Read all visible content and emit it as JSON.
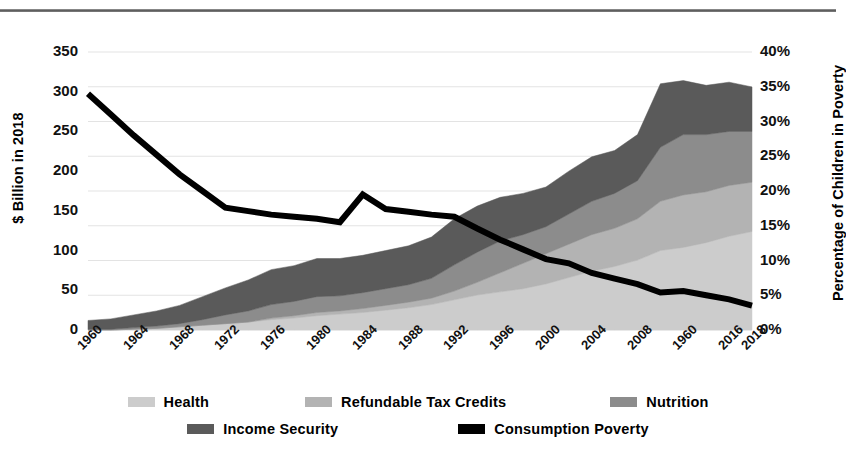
{
  "chart_data": {
    "type": "area",
    "title": "",
    "subtitle": "",
    "xlabel": "",
    "ylabel": "$ Billion in 2018",
    "y2label": "Percentage of Children in Poverty",
    "grid": true,
    "legend_position": "bottom",
    "ylim": [
      0,
      350
    ],
    "y2lim": [
      0,
      40
    ],
    "xlim": [
      1960,
      2018
    ],
    "yticks": [
      "0",
      "50",
      "100",
      "150",
      "200",
      "250",
      "300",
      "350"
    ],
    "ytick_values": [
      0,
      50,
      100,
      150,
      200,
      250,
      300,
      350
    ],
    "y2ticks": [
      "0%",
      "5%",
      "10%",
      "15%",
      "20%",
      "25%",
      "30%",
      "35%",
      "40%"
    ],
    "y2tick_values": [
      0,
      5,
      10,
      15,
      20,
      25,
      30,
      35,
      40
    ],
    "xticks": [
      "1960",
      "1964",
      "1968",
      "1972",
      "1976",
      "1980",
      "1984",
      "1988",
      "1992",
      "1996",
      "2000",
      "2004",
      "2008",
      "1960",
      "2016",
      "2018"
    ],
    "xtick_values": [
      1960,
      1964,
      1968,
      1972,
      1976,
      1980,
      1984,
      1988,
      1992,
      1996,
      2000,
      2004,
      2008,
      2012,
      2016,
      2018
    ],
    "x": [
      1960,
      1962,
      1964,
      1966,
      1968,
      1970,
      1972,
      1974,
      1976,
      1978,
      1980,
      1982,
      1984,
      1986,
      1988,
      1990,
      1992,
      1994,
      1996,
      1998,
      2000,
      2002,
      2004,
      2006,
      2008,
      2010,
      2012,
      2014,
      2016,
      2018
    ],
    "stack_order_bottom_to_top": [
      "Health",
      "Refundable Tax Credits",
      "Nutrition",
      "Income Security"
    ],
    "series": [
      {
        "name": "Health",
        "axis": "left",
        "color": "#cccccc",
        "values": [
          0,
          0,
          1,
          2,
          4,
          6,
          8,
          10,
          13,
          15,
          18,
          20,
          22,
          25,
          28,
          32,
          38,
          44,
          48,
          52,
          58,
          66,
          74,
          80,
          88,
          100,
          104,
          110,
          118,
          124
        ]
      },
      {
        "name": "Refundable Tax Credits",
        "axis": "left",
        "color": "#b3b3b3",
        "values": [
          0,
          0,
          0,
          0,
          0,
          0,
          0,
          0,
          2,
          3,
          4,
          4,
          5,
          6,
          7,
          8,
          11,
          16,
          24,
          32,
          38,
          42,
          46,
          48,
          52,
          62,
          66,
          64,
          64,
          62
        ]
      },
      {
        "name": "Nutrition",
        "axis": "left",
        "color": "#8c8c8c",
        "values": [
          1,
          1,
          2,
          3,
          4,
          7,
          11,
          14,
          17,
          18,
          20,
          19,
          20,
          21,
          22,
          25,
          33,
          38,
          40,
          36,
          34,
          38,
          42,
          44,
          48,
          68,
          76,
          72,
          68,
          64
        ]
      },
      {
        "name": "Income Security",
        "axis": "left",
        "color": "#5a5a5a",
        "values": [
          11,
          13,
          16,
          19,
          23,
          29,
          34,
          39,
          44,
          45,
          48,
          47,
          47,
          48,
          49,
          52,
          58,
          58,
          55,
          52,
          50,
          54,
          56,
          54,
          58,
          80,
          68,
          62,
          62,
          56
        ]
      },
      {
        "name": "Consumption Poverty",
        "axis": "right",
        "color": "#000000",
        "unit": "%",
        "values": [
          34.0,
          31.0,
          28.0,
          25.2,
          22.4,
          20.0,
          17.6,
          17.1,
          16.6,
          16.3,
          16.0,
          15.5,
          19.5,
          17.4,
          17.0,
          16.6,
          16.3,
          14.6,
          13.0,
          11.6,
          10.2,
          9.6,
          8.2,
          7.4,
          6.6,
          5.4,
          5.6,
          5.0,
          4.4,
          3.5
        ]
      }
    ],
    "totals": [
      12,
      14,
      19,
      24,
      31,
      42,
      53,
      63,
      76,
      81,
      90,
      90,
      94,
      100,
      106,
      117,
      140,
      156,
      167,
      172,
      180,
      200,
      218,
      226,
      246,
      310,
      314,
      308,
      312,
      306
    ]
  },
  "legend": {
    "rows": [
      [
        {
          "label": "Health",
          "color": "#cccccc"
        },
        {
          "label": "Refundable Tax Credits",
          "color": "#b3b3b3"
        },
        {
          "label": "Nutrition",
          "color": "#8c8c8c"
        }
      ],
      [
        {
          "label": "Income Security",
          "color": "#5a5a5a"
        },
        {
          "label": "Consumption Poverty",
          "color": "#000000"
        }
      ]
    ]
  }
}
